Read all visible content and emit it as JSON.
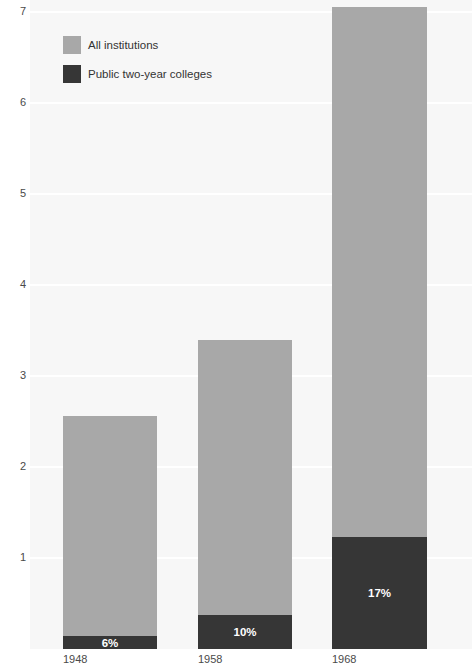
{
  "chart_data": {
    "type": "bar",
    "stacked": true,
    "title": "",
    "subtitle": "",
    "xlabel": "",
    "ylabel": "",
    "categories": [
      "1948",
      "1958",
      "1968"
    ],
    "series": [
      {
        "name": "Public two-year colleges",
        "color": "#363636",
        "values": [
          0.14,
          0.37,
          1.23
        ],
        "point_labels": [
          "6%",
          "10%",
          "17%"
        ]
      },
      {
        "name": "All institutions",
        "color": "#a8a8a8",
        "values": [
          2.42,
          3.03,
          5.82
        ],
        "point_labels": [
          "",
          "",
          ""
        ]
      }
    ],
    "totals": [
      2.56,
      3.4,
      7.05
    ],
    "ylim": [
      0,
      7.15
    ],
    "yticks": [
      1,
      2,
      3,
      4,
      5,
      6,
      7
    ],
    "ytick_labels": [
      "1",
      "2",
      "3",
      "4",
      "5",
      "6",
      "7"
    ],
    "grid": true,
    "grid_color": "#ffffff",
    "legend_position": "top-left",
    "plot_background": "#f7f7f7",
    "page_background": "#ffffff"
  },
  "legend": {
    "items": [
      {
        "label": "All institutions",
        "color": "#a8a8a8",
        "swatch_name": "legend-swatch-all-institutions"
      },
      {
        "label": "Public two-year colleges",
        "color": "#363636",
        "swatch_name": "legend-swatch-public-two-year"
      }
    ]
  },
  "axes": {
    "y": {
      "labels": [
        "7",
        "6",
        "5",
        "4",
        "3",
        "2",
        "1"
      ]
    },
    "x": {
      "labels": [
        "1948",
        "1958",
        "1968"
      ]
    }
  },
  "bars": [
    {
      "category": "1948",
      "total": 2.56,
      "all_value": 2.42,
      "public_value": 0.14,
      "public_label": "6%"
    },
    {
      "category": "1958",
      "total": 3.4,
      "all_value": 3.03,
      "public_value": 0.37,
      "public_label": "10%"
    },
    {
      "category": "1968",
      "total": 7.05,
      "all_value": 5.82,
      "public_value": 1.23,
      "public_label": "17%"
    }
  ]
}
